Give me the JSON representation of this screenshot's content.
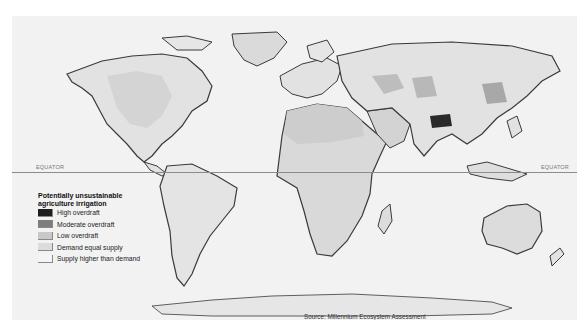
{
  "map": {
    "title": "Potentially unsustainable agriculture irrigation",
    "equator": {
      "label_left": "EQUATOR",
      "label_right": "EQUATOR"
    },
    "legend": {
      "title": "Potentially unsustainable agriculture irrigation",
      "items": [
        {
          "label": "High overdraft",
          "color": "#1e1e1e"
        },
        {
          "label": "Moderate overdraft",
          "color": "#7d7d7d"
        },
        {
          "label": "Low overdraft",
          "color": "#c8c8c8"
        },
        {
          "label": "Demand equal supply",
          "color": "#dcdcdc"
        },
        {
          "label": "Supply higher than demand",
          "color": "#f4f4f4"
        }
      ]
    },
    "source": "Source: Millennium Ecosystem Assessment",
    "colors": {
      "background": "#f2f2f2",
      "land_light": "#e4e4e4",
      "land_mid": "#d2d2d2",
      "coast": "#3a3a3a",
      "equator": "#8c8c8c"
    }
  }
}
